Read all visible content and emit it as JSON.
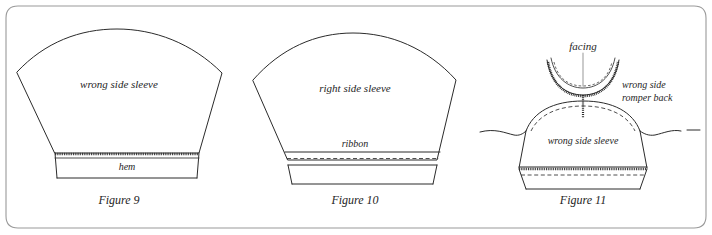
{
  "document": {
    "kind": "sewing-instruction-diagram",
    "background_color": "#ffffff",
    "ink_color": "#2b2b2b",
    "frame_color": "#9a9a9a"
  },
  "figures": [
    {
      "id": "figure-9",
      "caption": "Figure 9",
      "labels": {
        "body": "wrong side sleeve",
        "hem": "hem"
      }
    },
    {
      "id": "figure-10",
      "caption": "Figure 10",
      "labels": {
        "body": "right side sleeve",
        "ribbon": "ribbon"
      }
    },
    {
      "id": "figure-11",
      "caption": "Figure 11",
      "labels": {
        "facing": "facing",
        "romper_back_line1": "wrong side",
        "romper_back_line2": "romper back",
        "body": "wrong side sleeve"
      }
    }
  ]
}
